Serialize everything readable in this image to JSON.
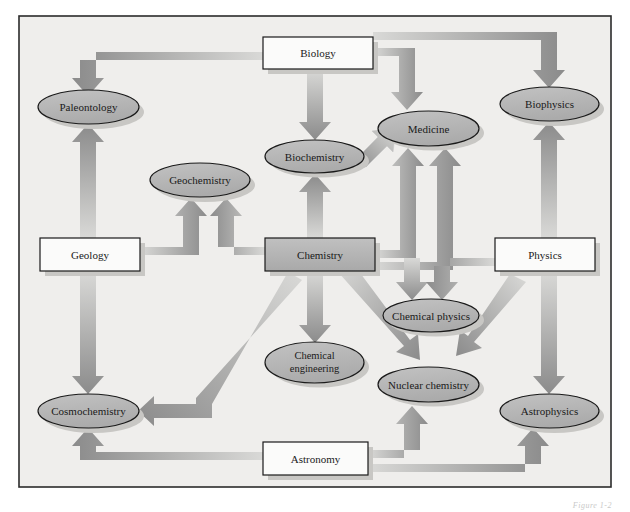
{
  "figure": {
    "caption": "Figure 1-2",
    "frame": {
      "x": 19,
      "y": 16,
      "width": 592,
      "height": 471,
      "background": "#efeeec",
      "border": "#2b2b2b"
    },
    "colors": {
      "box_fill_white": "#fbfbfa",
      "box_fill_gray": "#b8b8b8",
      "ellipse_fill": "#b6b6b6",
      "outline": "#1a1a1a",
      "arrow_dark": "#8a8a8a",
      "arrow_light": "#d8d8d6",
      "shadow": "#c8c7c4"
    }
  },
  "nodes": [
    {
      "id": "biology",
      "label": "Biology",
      "shape": "rect",
      "fill": "white",
      "x": 263,
      "y": 37,
      "w": 110,
      "h": 32
    },
    {
      "id": "geology",
      "label": "Geology",
      "shape": "rect",
      "fill": "white",
      "x": 40,
      "y": 238,
      "w": 100,
      "h": 33
    },
    {
      "id": "chemistry",
      "label": "Chemistry",
      "shape": "rect",
      "fill": "gray",
      "x": 265,
      "y": 238,
      "w": 110,
      "h": 33
    },
    {
      "id": "physics",
      "label": "Physics",
      "shape": "rect",
      "fill": "white",
      "x": 495,
      "y": 238,
      "w": 100,
      "h": 33
    },
    {
      "id": "astronomy",
      "label": "Astronomy",
      "shape": "rect",
      "fill": "white",
      "x": 263,
      "y": 442,
      "w": 105,
      "h": 33
    },
    {
      "id": "paleontology",
      "label": "Paleontology",
      "shape": "ellipse",
      "x": 38,
      "y": 90,
      "w": 101,
      "h": 34
    },
    {
      "id": "geochemistry",
      "label": "Geochemistry",
      "shape": "ellipse",
      "x": 150,
      "y": 163,
      "w": 100,
      "h": 34
    },
    {
      "id": "biochemistry",
      "label": "Biochemistry",
      "shape": "ellipse",
      "x": 265,
      "y": 140,
      "w": 99,
      "h": 33
    },
    {
      "id": "medicine",
      "label": "Medicine",
      "shape": "ellipse",
      "x": 378,
      "y": 111,
      "w": 101,
      "h": 35
    },
    {
      "id": "biophysics",
      "label": "Biophysics",
      "shape": "ellipse",
      "x": 500,
      "y": 87,
      "w": 99,
      "h": 34
    },
    {
      "id": "chemical_physics",
      "label": "Chemical physics",
      "shape": "ellipse",
      "x": 383,
      "y": 299,
      "w": 96,
      "h": 33
    },
    {
      "id": "chemical_engineering",
      "label_line1": "Chemical",
      "label_line2": "engineering",
      "label": "Chemical engineering",
      "shape": "ellipse",
      "x": 265,
      "y": 342,
      "w": 99,
      "h": 41
    },
    {
      "id": "nuclear_chemistry",
      "label": "Nuclear chemistry",
      "shape": "ellipse",
      "x": 378,
      "y": 367,
      "w": 101,
      "h": 35
    },
    {
      "id": "astrophysics",
      "label": "Astrophysics",
      "shape": "ellipse",
      "x": 500,
      "y": 394,
      "w": 99,
      "h": 34
    },
    {
      "id": "cosmochemistry",
      "label": "Cosmochemistry",
      "shape": "ellipse",
      "x": 38,
      "y": 394,
      "w": 101,
      "h": 34
    }
  ],
  "edges": [
    {
      "from": "biology",
      "to": "paleontology",
      "style": "elbow-left"
    },
    {
      "from": "biology",
      "to": "biochemistry",
      "style": "straight-down"
    },
    {
      "from": "biology",
      "to": "medicine",
      "style": "elbow-right-down"
    },
    {
      "from": "biology",
      "to": "biophysics",
      "style": "elbow-far-right"
    },
    {
      "from": "biochemistry",
      "to": "medicine",
      "style": "diagonal-up-right"
    },
    {
      "from": "geology",
      "to": "paleontology",
      "style": "straight-up"
    },
    {
      "from": "geology",
      "to": "geochemistry",
      "style": "elbow-up-right"
    },
    {
      "from": "geology",
      "to": "cosmochemistry",
      "style": "straight-down"
    },
    {
      "from": "chemistry",
      "to": "geochemistry",
      "style": "elbow-up-left"
    },
    {
      "from": "chemistry",
      "to": "biochemistry",
      "style": "straight-up"
    },
    {
      "from": "chemistry",
      "to": "medicine",
      "style": "straight-up-right"
    },
    {
      "from": "chemistry",
      "to": "chemical_physics",
      "style": "straight-up-from-below"
    },
    {
      "from": "chemistry",
      "to": "chemical_engineering",
      "style": "straight-down"
    },
    {
      "from": "chemistry",
      "to": "nuclear_chemistry",
      "style": "diagonal-down-right"
    },
    {
      "from": "chemistry",
      "to": "cosmochemistry",
      "style": "diagonal-down-left-elbow"
    },
    {
      "from": "physics",
      "to": "biophysics",
      "style": "straight-up"
    },
    {
      "from": "physics",
      "to": "medicine",
      "style": "elbow-left-up"
    },
    {
      "from": "physics",
      "to": "chemical_physics",
      "style": "elbow-left-down"
    },
    {
      "from": "physics",
      "to": "nuclear_chemistry",
      "style": "diagonal-down-left"
    },
    {
      "from": "physics",
      "to": "astrophysics",
      "style": "straight-down"
    },
    {
      "from": "astronomy",
      "to": "cosmochemistry",
      "style": "elbow-left"
    },
    {
      "from": "astronomy",
      "to": "nuclear_chemistry",
      "style": "elbow-up"
    },
    {
      "from": "astronomy",
      "to": "astrophysics",
      "style": "elbow-right-up"
    }
  ]
}
